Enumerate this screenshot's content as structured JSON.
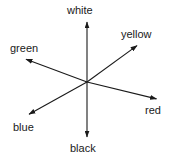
{
  "diagram": {
    "background_color": "#ffffff",
    "line_color": "#1a1a1a",
    "text_color": "#1a1a1a",
    "center": {
      "x": 87,
      "y": 82
    },
    "axes": [
      {
        "name": "white-black-axis",
        "orientation": "vertical",
        "positive_label": "white",
        "negative_label": "black",
        "positive_tip": {
          "x": 87,
          "y": 19
        },
        "negative_tip": {
          "x": 87,
          "y": 140
        }
      },
      {
        "name": "green-red-axis",
        "orientation": "diagonal-shallow",
        "positive_label": "green",
        "negative_label": "red",
        "positive_tip": {
          "x": 22,
          "y": 58
        },
        "negative_tip": {
          "x": 160,
          "y": 100
        }
      },
      {
        "name": "blue-yellow-axis",
        "orientation": "diagonal-steep",
        "positive_label": "yellow",
        "negative_label": "blue",
        "positive_tip": {
          "x": 141,
          "y": 43
        },
        "negative_tip": {
          "x": 25,
          "y": 118
        }
      }
    ],
    "labels": {
      "white": "white",
      "yellow": "yellow",
      "green": "green",
      "red": "red",
      "blue": "blue",
      "black": "black"
    }
  }
}
